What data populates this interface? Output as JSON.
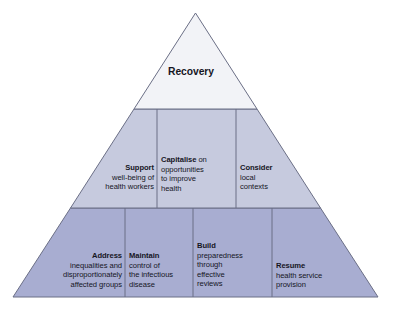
{
  "figure": {
    "name": "recovery-pyramid",
    "type": "pyramid-diagram",
    "colors": {
      "tier_top_fill": "#f2f3f7",
      "tier_middle_fill": "#c6cade",
      "tier_bottom_fill": "#a8add1",
      "outline": "#6b6f86",
      "divider": "#6b6f86",
      "text": "#16161f",
      "background": "#ffffff"
    },
    "tiers": [
      {
        "id": "tier-top",
        "level": 1,
        "fill": "#f2f3f7",
        "blocks": [
          {
            "id": "recovery",
            "title": "Recovery",
            "lines": [],
            "align": "center"
          }
        ]
      },
      {
        "id": "tier-middle",
        "level": 2,
        "fill": "#c6cade",
        "blocks": [
          {
            "id": "support",
            "title": "Support",
            "lines": [
              "well-being of",
              "health workers"
            ],
            "align": "right"
          },
          {
            "id": "capitalise",
            "title": "Capitalise",
            "title_suffix": " on",
            "lines": [
              "opportunities",
              "to improve",
              "health"
            ],
            "align": "left"
          },
          {
            "id": "consider",
            "title": "Consider",
            "lines": [
              "local",
              "contexts"
            ],
            "align": "left"
          }
        ]
      },
      {
        "id": "tier-bottom",
        "level": 3,
        "fill": "#a8add1",
        "blocks": [
          {
            "id": "address",
            "title": "Address",
            "lines": [
              "inequalities and",
              "disproportionately",
              "affected groups"
            ],
            "align": "right"
          },
          {
            "id": "maintain",
            "title": "Maintain",
            "lines": [
              "control of",
              "the infectious",
              "disease"
            ],
            "align": "left"
          },
          {
            "id": "build",
            "title": "Build",
            "lines": [
              "preparedness",
              "through",
              "effective",
              "reviews"
            ],
            "align": "left"
          },
          {
            "id": "resume",
            "title": "Resume",
            "lines": [
              "health service",
              "provision"
            ],
            "align": "left"
          }
        ]
      }
    ]
  },
  "labels": {
    "recovery": {
      "title": "Recovery"
    },
    "support": {
      "title": "Support",
      "l1": "well-being of",
      "l2": "health workers"
    },
    "capitalise": {
      "title": "Capitalise",
      "suffix": " on",
      "l1": "opportunities",
      "l2": "to improve",
      "l3": "health"
    },
    "consider": {
      "title": "Consider",
      "l1": "local",
      "l2": "contexts"
    },
    "address": {
      "title": "Address",
      "l1": "inequalities and",
      "l2": "disproportionately",
      "l3": "affected groups"
    },
    "maintain": {
      "title": "Maintain",
      "l1": "control of",
      "l2": "the infectious",
      "l3": "disease"
    },
    "build": {
      "title": "Build",
      "l1": "preparedness",
      "l2": "through",
      "l3": "effective",
      "l4": "reviews"
    },
    "resume": {
      "title": "Resume",
      "l1": "health service",
      "l2": "provision"
    }
  }
}
